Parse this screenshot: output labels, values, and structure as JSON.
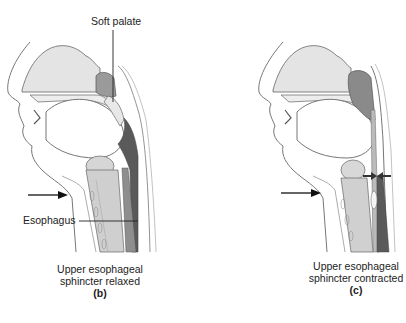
{
  "figure": {
    "panels": [
      {
        "id": "b",
        "letter": "(b)",
        "caption_line1": "Upper esophageal",
        "caption_line2": "sphincter relaxed",
        "labels": {
          "soft_palate": "Soft palate",
          "esophagus": "Esophagus"
        },
        "state": "relaxed"
      },
      {
        "id": "c",
        "letter": "(c)",
        "caption_line1": "Upper esophageal",
        "caption_line2": "sphincter contracted",
        "state": "contracted"
      }
    ],
    "colors": {
      "outline": "#555555",
      "tissue_light": "#e2e2e2",
      "tissue_mid": "#b8b8b8",
      "tissue_dark": "#5a5a5a",
      "text": "#222222"
    }
  }
}
